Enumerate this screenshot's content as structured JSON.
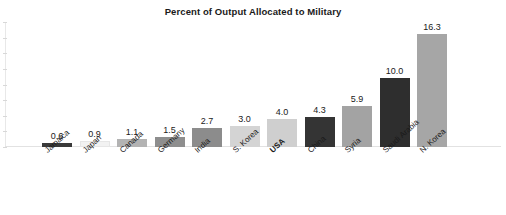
{
  "chart_data": {
    "type": "bar",
    "title": "Percent of Output Allocated to Military",
    "xlabel": "",
    "ylabel": "",
    "ylim": [
      0,
      18
    ],
    "grid": false,
    "legend": null,
    "categories": [
      "Jamaica",
      "Japan",
      "Canada",
      "Germany",
      "India",
      "S. Korea",
      "USA",
      "China",
      "Syria",
      "Saudi Arabia",
      "N. Korea"
    ],
    "values": [
      0.6,
      0.9,
      1.1,
      1.5,
      2.7,
      3.0,
      4.0,
      4.3,
      5.9,
      10.0,
      16.3
    ],
    "value_labels": [
      "0.6",
      "0.9",
      "1.1",
      "1.5",
      "2.7",
      "3.0",
      "4.0",
      "4.3",
      "5.9",
      "10.0",
      "16.3"
    ],
    "bar_colors": [
      "#3a3a3a",
      "#f2f2f2",
      "#b3b3b3",
      "#8e8e8e",
      "#8c8c8c",
      "#d4d4d4",
      "#cfcfcf",
      "#343434",
      "#a3a3a3",
      "#2e2e2e",
      "#a6a6a6"
    ],
    "highlight_category": "USA",
    "annotations": []
  },
  "colors": {
    "background": "#ffffff",
    "text": "#1a1a1a",
    "axis": "#e2e2e2"
  }
}
